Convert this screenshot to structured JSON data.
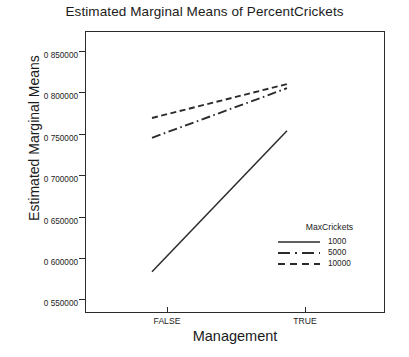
{
  "chart_data": {
    "type": "line",
    "title": "Estimated Marginal Means of PercentCrickets",
    "xlabel": "Management",
    "ylabel": "Estimated Marginal Means",
    "categories": [
      "FALSE",
      "TRUE"
    ],
    "x_tick_labels": [
      "FALSE",
      "TRUE"
    ],
    "y_tick_labels": [
      "0 850000",
      "0 800000",
      "0 750000",
      "0 700000",
      "0 650000",
      "0 600000",
      "0 550000"
    ],
    "y_tick_values": [
      0.85,
      0.8,
      0.75,
      0.7,
      0.65,
      0.6,
      0.55
    ],
    "ylim": [
      0.525,
      0.875
    ],
    "grid": false,
    "legend_title": "MaxCrickets",
    "legend_position": "inside-lower-right",
    "series": [
      {
        "name": "1000",
        "style": "solid",
        "color": "#2b2b2b",
        "values": [
          0.583,
          0.7535
        ]
      },
      {
        "name": "5000",
        "style": "dash-dot",
        "color": "#2b2b2b",
        "values": [
          0.745,
          0.805
        ]
      },
      {
        "name": "10000",
        "style": "dashed",
        "color": "#2b2b2b",
        "values": [
          0.769,
          0.81
        ]
      }
    ]
  },
  "colors": {
    "background": "#ffffff",
    "axis": "#2b2b2b",
    "text": "#1b1b1b",
    "line": "#2b2b2b"
  }
}
